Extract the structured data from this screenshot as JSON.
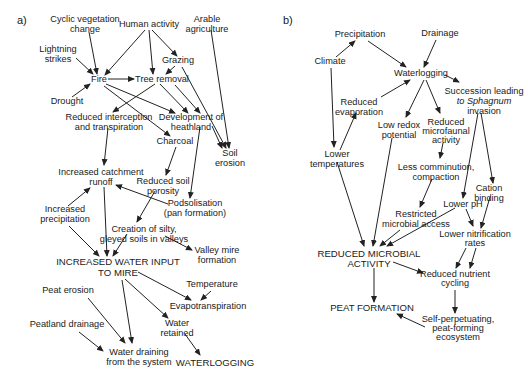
{
  "panels": [
    {
      "label": "a)",
      "nodes": [
        {
          "id": "cyclic",
          "lines": [
            "Cyclic vegetation",
            "change"
          ],
          "x": 85,
          "y": 22
        },
        {
          "id": "human",
          "lines": [
            "Human activity"
          ],
          "x": 149,
          "y": 27
        },
        {
          "id": "arable",
          "lines": [
            "Arable",
            "agriculture"
          ],
          "x": 207,
          "y": 22
        },
        {
          "id": "lightning",
          "lines": [
            "Lightning",
            "strikes"
          ],
          "x": 58,
          "y": 52
        },
        {
          "id": "grazing",
          "lines": [
            "Grazing"
          ],
          "x": 178,
          "y": 63
        },
        {
          "id": "fire",
          "lines": [
            "Fire"
          ],
          "x": 99,
          "y": 82
        },
        {
          "id": "tree",
          "lines": [
            "Tree removal"
          ],
          "x": 162,
          "y": 82
        },
        {
          "id": "drought",
          "lines": [
            "Drought"
          ],
          "x": 67,
          "y": 104
        },
        {
          "id": "reduced_int",
          "lines": [
            "Reduced interception",
            "and transpiration"
          ],
          "x": 109,
          "y": 120
        },
        {
          "id": "heath",
          "lines": [
            "Development of",
            "heathland"
          ],
          "x": 191,
          "y": 120
        },
        {
          "id": "charcoal",
          "lines": [
            "Charcoal"
          ],
          "x": 175,
          "y": 144
        },
        {
          "id": "soil_erosion",
          "lines": [
            "Soil",
            "erosion"
          ],
          "x": 230,
          "y": 156
        },
        {
          "id": "catchment",
          "lines": [
            "Increased catchment",
            "runoff"
          ],
          "x": 101,
          "y": 175
        },
        {
          "id": "porosity",
          "lines": [
            "Reduced soil",
            "porosity"
          ],
          "x": 163,
          "y": 184
        },
        {
          "id": "podsol",
          "lines": [
            "Podsolisation",
            "(pan formation)"
          ],
          "x": 195,
          "y": 206
        },
        {
          "id": "precip",
          "lines": [
            "Increased",
            "precipitation"
          ],
          "x": 65,
          "y": 212
        },
        {
          "id": "silty",
          "lines": [
            "Creation of silty,",
            "gleyed soils in valleys"
          ],
          "x": 144,
          "y": 232
        },
        {
          "id": "valley",
          "lines": [
            "Valley mire",
            "formation"
          ],
          "x": 217,
          "y": 253
        },
        {
          "id": "water_input",
          "lines": [
            "INCREASED WATER INPUT",
            "TO MIRE"
          ],
          "x": 118,
          "y": 265,
          "caps": true
        },
        {
          "id": "temperature",
          "lines": [
            "Temperature"
          ],
          "x": 212,
          "y": 287
        },
        {
          "id": "peat_erosion",
          "lines": [
            "Peat erosion"
          ],
          "x": 68,
          "y": 293
        },
        {
          "id": "evapo",
          "lines": [
            "Evapotranspiration"
          ],
          "x": 208,
          "y": 309
        },
        {
          "id": "water_ret",
          "lines": [
            "Water",
            "retained"
          ],
          "x": 177,
          "y": 326
        },
        {
          "id": "peat_drain",
          "lines": [
            "Peatland drainage"
          ],
          "x": 67,
          "y": 327
        },
        {
          "id": "draining",
          "lines": [
            "Water draining",
            "from the system"
          ],
          "x": 139,
          "y": 352
        },
        {
          "id": "waterlog_a",
          "lines": [
            "WATERLOGGING"
          ],
          "x": 215,
          "y": 365,
          "caps": true
        }
      ]
    },
    {
      "label": "b)",
      "nodes": [
        {
          "id": "precipitation",
          "lines": [
            "Precipitation"
          ],
          "x": 360,
          "y": 37
        },
        {
          "id": "drainage",
          "lines": [
            "Drainage"
          ],
          "x": 440,
          "y": 36
        },
        {
          "id": "climate",
          "lines": [
            "Climate"
          ],
          "x": 330,
          "y": 64
        },
        {
          "id": "waterlogging",
          "lines": [
            "Waterlogging"
          ],
          "x": 421,
          "y": 76
        },
        {
          "id": "succession",
          "lines": [
            "Succession leading",
            "to Sphagnum",
            "invasion"
          ],
          "x": 484,
          "y": 94
        },
        {
          "id": "red_evap",
          "lines": [
            "Reduced",
            "evaporation"
          ],
          "x": 359,
          "y": 105
        },
        {
          "id": "low_redox",
          "lines": [
            "Low redox",
            "potential"
          ],
          "x": 399,
          "y": 128
        },
        {
          "id": "microfaunal",
          "lines": [
            "Reduced",
            "microfaunal",
            "activity"
          ],
          "x": 446,
          "y": 125
        },
        {
          "id": "lower_temp",
          "lines": [
            "Lower",
            "temperatures"
          ],
          "x": 337,
          "y": 157
        },
        {
          "id": "comminution",
          "lines": [
            "Less comminution,",
            "compaction"
          ],
          "x": 436,
          "y": 170
        },
        {
          "id": "cation",
          "lines": [
            "Cation",
            "binding"
          ],
          "x": 489,
          "y": 191
        },
        {
          "id": "lower_ph",
          "lines": [
            "Lower pH"
          ],
          "x": 463,
          "y": 205
        },
        {
          "id": "restricted",
          "lines": [
            "Restricted",
            "microbial access"
          ],
          "x": 416,
          "y": 217
        },
        {
          "id": "nitrification",
          "lines": [
            "Lower nitrification",
            "rates"
          ],
          "x": 475,
          "y": 235
        },
        {
          "id": "rma",
          "lines": [
            "REDUCED MICROBIAL",
            "ACTIVITY"
          ],
          "x": 369,
          "y": 257,
          "caps": true
        },
        {
          "id": "nutrient",
          "lines": [
            "Reduced nutrient",
            "cycling"
          ],
          "x": 455,
          "y": 276
        },
        {
          "id": "peat_form",
          "lines": [
            "PEAT FORMATION"
          ],
          "x": 372,
          "y": 310,
          "caps": true
        },
        {
          "id": "self_perp",
          "lines": [
            "Self-perpetuating,",
            "peat-forming",
            "ecosystem"
          ],
          "x": 458,
          "y": 320
        }
      ]
    }
  ],
  "caption": "",
  "colors": {
    "ink": "#1a1a1a",
    "background": "#ffffff"
  }
}
